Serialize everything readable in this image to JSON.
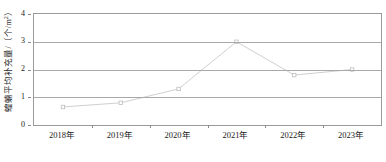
{
  "chart_data": {
    "type": "line",
    "title": "",
    "xlabel": "",
    "ylabel": "蝗蝻平均补充量/（个/m²）",
    "ylabel_text": "蝗蝻平均补充量/（个/m",
    "ylabel_sup": "2",
    "ylabel_tail": "）",
    "categories": [
      "2018年",
      "2019年",
      "2020年",
      "2021年",
      "2022年",
      "2023年"
    ],
    "values": [
      0.65,
      0.8,
      1.3,
      3.0,
      1.8,
      2.0
    ],
    "ylim": [
      0,
      4
    ],
    "yticks": [
      "0",
      "1",
      "2",
      "3",
      "4"
    ],
    "ytick_values": [
      0,
      1,
      2,
      3,
      4
    ],
    "grid": true,
    "legend": "none",
    "series_name": "蝗蝻平均补充量",
    "line_color": "#c9c9c9",
    "marker_color": "#bdbdbd",
    "axis_color": "#9a9a9a",
    "grid_color": "#a9a9a9",
    "background": "#ffffff"
  },
  "figure": {
    "caption_partial": ""
  }
}
